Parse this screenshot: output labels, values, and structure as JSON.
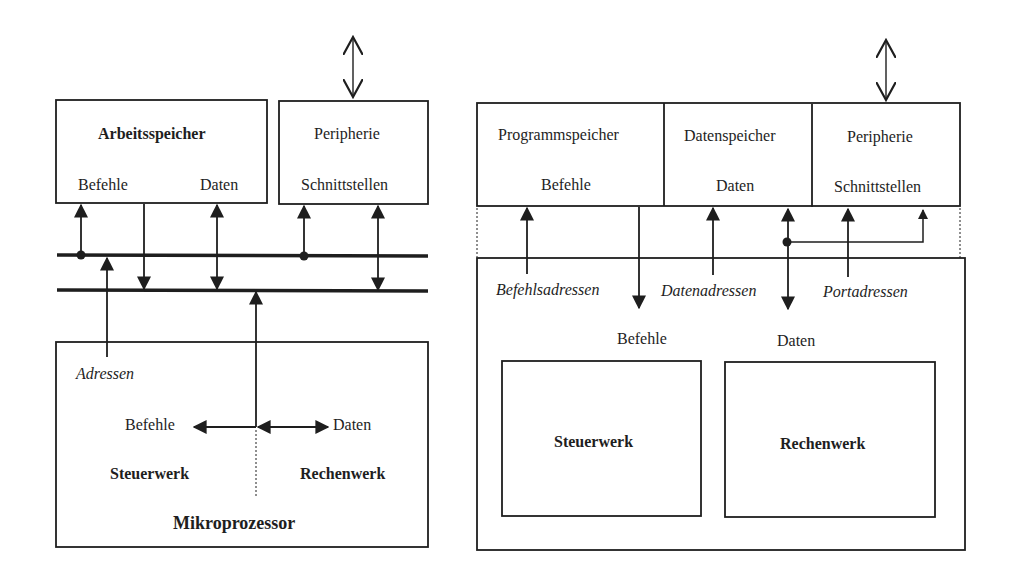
{
  "left_diagram": {
    "name": "Von-Neumann-Architektur",
    "memory": {
      "title": "Arbeitsspeicher",
      "left_label": "Befehle",
      "right_label": "Daten"
    },
    "peripheral": {
      "title": "Peripherie",
      "subtitle": "Schnittstellen"
    },
    "address_label": "Adressen",
    "cpu": {
      "instr_label": "Befehle",
      "data_label": "Daten",
      "control_unit": "Steuerwerk",
      "alu": "Rechenwerk",
      "title": "Mikroprozessor"
    }
  },
  "right_diagram": {
    "name": "Harvard-Architektur",
    "program_memory": {
      "title": "Programmspeicher",
      "label": "Befehle"
    },
    "data_memory": {
      "title": "Datenspeicher",
      "label": "Daten"
    },
    "peripheral": {
      "title": "Peripherie",
      "subtitle": "Schnittstellen"
    },
    "bus_labels": {
      "instr_addr": "Befehlsadressen",
      "data_addr": "Datenadressen",
      "port_addr": "Portadressen"
    },
    "cpu": {
      "instr_label": "Befehle",
      "data_label": "Daten",
      "control_unit": "Steuerwerk",
      "alu": "Rechenwerk"
    }
  },
  "colors": {
    "stroke": "#1e1e1e",
    "background": "#ffffff"
  }
}
